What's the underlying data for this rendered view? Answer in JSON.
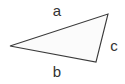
{
  "diagram": {
    "type": "triangle",
    "background_color": "#ffffff",
    "stroke_color": "#3a3a3a",
    "fill_color": "#fbfbfb",
    "stroke_width": 1.1,
    "vertices": [
      {
        "name": "left-apex",
        "x": 10,
        "y": 46
      },
      {
        "name": "top-right-vertex",
        "x": 108,
        "y": 14
      },
      {
        "name": "bottom-right-vertex",
        "x": 96,
        "y": 62
      }
    ],
    "sides": [
      {
        "label": "a",
        "position": "top",
        "from": "left-apex",
        "to": "top-right-vertex",
        "label_color": "#333333"
      },
      {
        "label": "b",
        "position": "bottom",
        "from": "left-apex",
        "to": "bottom-right-vertex",
        "label_color": "#333333"
      },
      {
        "label": "c",
        "position": "right",
        "from": "top-right-vertex",
        "to": "bottom-right-vertex",
        "label_color": "#333333"
      }
    ],
    "labels": {
      "side_a": "a",
      "side_b": "b",
      "side_c": "c"
    }
  }
}
